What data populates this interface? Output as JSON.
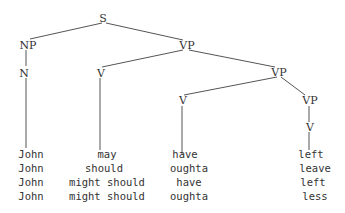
{
  "tree": {
    "nodes": {
      "s": "S",
      "np": "NP",
      "n": "N",
      "vp1": "VP",
      "v1": "V",
      "vp2": "VP",
      "v2": "V",
      "vp3": "VP",
      "v3": "V"
    }
  },
  "rows": [
    [
      "John",
      "may",
      "have",
      "left"
    ],
    [
      "John",
      "should",
      "oughta",
      "leave"
    ],
    [
      "John",
      "might should",
      "have",
      "left"
    ],
    [
      "John",
      "might should",
      "oughta",
      "less"
    ]
  ]
}
